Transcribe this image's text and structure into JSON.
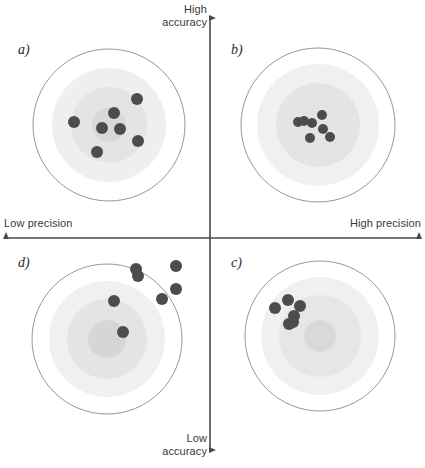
{
  "figure": {
    "width": 425,
    "height": 468,
    "background": "#ffffff"
  },
  "axes": {
    "vertical": {
      "top_label_line1": "High",
      "top_label_line2": "accuracy",
      "bottom_label_line1": "Low",
      "bottom_label_line2": "accuracy",
      "x": 210,
      "y_top": 18,
      "y_bottom": 450,
      "color": "#4a4a4a"
    },
    "horizontal": {
      "left_label": "Low precision",
      "right_label": "High precision",
      "y": 238,
      "x_left": 6,
      "x_right": 419,
      "color": "#4a4a4a"
    }
  },
  "colors": {
    "dot": "#4c4c4c",
    "ring_outline": "#8a8a8a",
    "ring_fill_outer": "#fbfbfb",
    "ring_fill_mid": "#ededed",
    "ring_fill_inner": "#e2e2e2",
    "ring_fill_core": "#d6d6d6",
    "text": "#3a3a3a"
  },
  "panels": [
    {
      "id": "a",
      "label": "a)",
      "quadrant": "top-left",
      "meaning": "low precision, high accuracy",
      "center": {
        "x": 109,
        "y": 125
      },
      "rings": [
        {
          "name": "outer-outline",
          "r": 76,
          "fill": "#ffffff",
          "stroke": "#8a8a8a"
        },
        {
          "name": "mid",
          "r": 57,
          "fill": "#efefef",
          "stroke": "none"
        },
        {
          "name": "inner",
          "r": 38,
          "fill": "#e4e4e4",
          "stroke": "none"
        },
        {
          "name": "core",
          "r": 17,
          "fill": "#d8d8d8",
          "stroke": "none"
        }
      ],
      "dots": [
        {
          "x": 137,
          "y": 99
        },
        {
          "x": 114,
          "y": 113
        },
        {
          "x": 74,
          "y": 122
        },
        {
          "x": 102,
          "y": 128
        },
        {
          "x": 120,
          "y": 129
        },
        {
          "x": 138,
          "y": 141
        },
        {
          "x": 97,
          "y": 152
        }
      ],
      "dot_radius": 6
    },
    {
      "id": "b",
      "label": "b)",
      "quadrant": "top-right",
      "meaning": "high precision, high accuracy",
      "center": {
        "x": 318,
        "y": 125
      },
      "rings": [
        {
          "name": "outer-outline",
          "r": 77,
          "fill": "#ffffff",
          "stroke": "#8a8a8a"
        },
        {
          "name": "mid",
          "r": 61,
          "fill": "#f0f0f0",
          "stroke": "none"
        },
        {
          "name": "inner",
          "r": 42,
          "fill": "#e4e4e4",
          "stroke": "none"
        }
      ],
      "dots": [
        {
          "x": 298,
          "y": 122
        },
        {
          "x": 304,
          "y": 121
        },
        {
          "x": 312,
          "y": 123
        },
        {
          "x": 322,
          "y": 115
        },
        {
          "x": 323,
          "y": 129
        },
        {
          "x": 310,
          "y": 138
        },
        {
          "x": 330,
          "y": 137
        }
      ],
      "dot_radius": 5
    },
    {
      "id": "d",
      "label": "d)",
      "quadrant": "bottom-left",
      "meaning": "low precision, low accuracy",
      "center": {
        "x": 107,
        "y": 339
      },
      "rings": [
        {
          "name": "outer-outline",
          "r": 75,
          "fill": "#ffffff",
          "stroke": "#8a8a8a"
        },
        {
          "name": "mid",
          "r": 58,
          "fill": "#f0f0f0",
          "stroke": "none"
        },
        {
          "name": "inner",
          "r": 40,
          "fill": "#e4e4e4",
          "stroke": "none"
        },
        {
          "name": "core",
          "r": 19,
          "fill": "#d6d6d6",
          "stroke": "none"
        }
      ],
      "dots": [
        {
          "x": 136,
          "y": 269
        },
        {
          "x": 138,
          "y": 276
        },
        {
          "x": 176,
          "y": 266
        },
        {
          "x": 176,
          "y": 289
        },
        {
          "x": 162,
          "y": 299
        },
        {
          "x": 114,
          "y": 301
        },
        {
          "x": 123,
          "y": 332
        }
      ],
      "dot_radius": 6
    },
    {
      "id": "c",
      "label": "c)",
      "quadrant": "bottom-right",
      "meaning": "high precision, low accuracy",
      "center": {
        "x": 320,
        "y": 336
      },
      "rings": [
        {
          "name": "outer-outline",
          "r": 75,
          "fill": "#ffffff",
          "stroke": "#8a8a8a"
        },
        {
          "name": "mid",
          "r": 59,
          "fill": "#f0f0f0",
          "stroke": "none"
        },
        {
          "name": "inner",
          "r": 41,
          "fill": "#e6e6e6",
          "stroke": "none"
        },
        {
          "name": "core",
          "r": 16,
          "fill": "#dadada",
          "stroke": "none"
        }
      ],
      "dots": [
        {
          "x": 275,
          "y": 308
        },
        {
          "x": 288,
          "y": 300
        },
        {
          "x": 300,
          "y": 306
        },
        {
          "x": 294,
          "y": 316
        },
        {
          "x": 293,
          "y": 322
        },
        {
          "x": 289,
          "y": 324
        }
      ],
      "dot_radius": 6
    }
  ]
}
